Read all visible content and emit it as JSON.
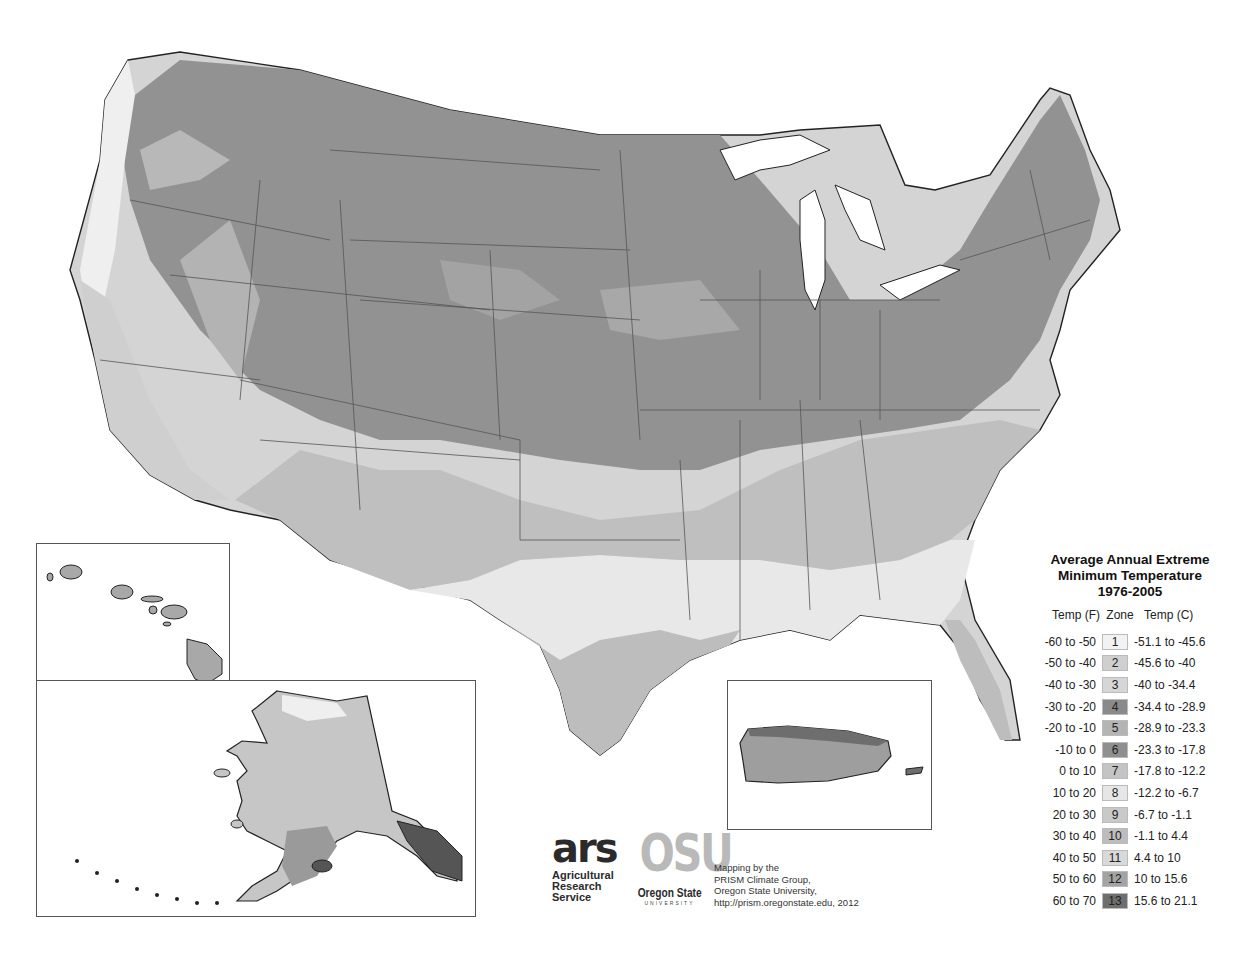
{
  "map": {
    "title_lines": [
      "Average Annual Extreme",
      "Minimum Temperature",
      "1976-2005"
    ],
    "region": "Contiguous United States",
    "insets": [
      "Hawaii",
      "Alaska",
      "Puerto Rico"
    ]
  },
  "legend": {
    "title_line1": "Average Annual Extreme",
    "title_line2": "Minimum Temperature",
    "title_line3": "1976-2005",
    "header_f": "Temp (F)",
    "header_zone": "Zone",
    "header_c": "Temp (C)",
    "rows": [
      {
        "f": "-60 to -50",
        "zone": "1",
        "c": "-51.1 to -45.6",
        "color": "#f2f2f2"
      },
      {
        "f": "-50 to -40",
        "zone": "2",
        "c": "-45.6 to -40",
        "color": "#cfcfcf"
      },
      {
        "f": "-40 to -30",
        "zone": "3",
        "c": "-40 to -34.4",
        "color": "#d6d6d6"
      },
      {
        "f": "-30 to -20",
        "zone": "4",
        "c": "-34.4 to -28.9",
        "color": "#8a8a8a"
      },
      {
        "f": "-20 to -10",
        "zone": "5",
        "c": "-28.9 to -23.3",
        "color": "#b4b4b4"
      },
      {
        "f": "-10 to 0",
        "zone": "6",
        "c": "-23.3 to -17.8",
        "color": "#8f8f8f"
      },
      {
        "f": "0 to 10",
        "zone": "7",
        "c": "-17.8 to -12.2",
        "color": "#c4c4c4"
      },
      {
        "f": "10 to 20",
        "zone": "8",
        "c": "-12.2 to -6.7",
        "color": "#e6e6e6"
      },
      {
        "f": "20 to 30",
        "zone": "9",
        "c": "-6.7 to -1.1",
        "color": "#c9c9c9"
      },
      {
        "f": "30 to 40",
        "zone": "10",
        "c": "-1.1 to 4.4",
        "color": "#bdbdbd"
      },
      {
        "f": "40 to 50",
        "zone": "11",
        "c": "4.4 to 10",
        "color": "#d9d9d9"
      },
      {
        "f": "50 to 60",
        "zone": "12",
        "c": "10 to 15.6",
        "color": "#a3a3a3"
      },
      {
        "f": "60 to 70",
        "zone": "13",
        "c": "15.6 to 21.1",
        "color": "#6e6e6e"
      }
    ]
  },
  "credits": {
    "ars_mark": "ars",
    "ars_line1": "Agricultural",
    "ars_line2": "Research",
    "ars_line3": "Service",
    "osu_mark": "OSU",
    "osu_name": "Oregon State",
    "osu_sub": "UNIVERSITY",
    "text_line1": "Mapping by the",
    "text_line2": "PRISM Climate Group,",
    "text_line3": "Oregon State University,",
    "text_line4": "http://prism.oregonstate.edu, 2012"
  },
  "colors": {
    "dark_zone": "#8c8c8c",
    "mid_zone": "#a8a8a8",
    "light_zone": "#c8c8c8",
    "lighter_zone": "#dcdcdc",
    "pale_zone": "#ececec",
    "border": "#444444"
  }
}
